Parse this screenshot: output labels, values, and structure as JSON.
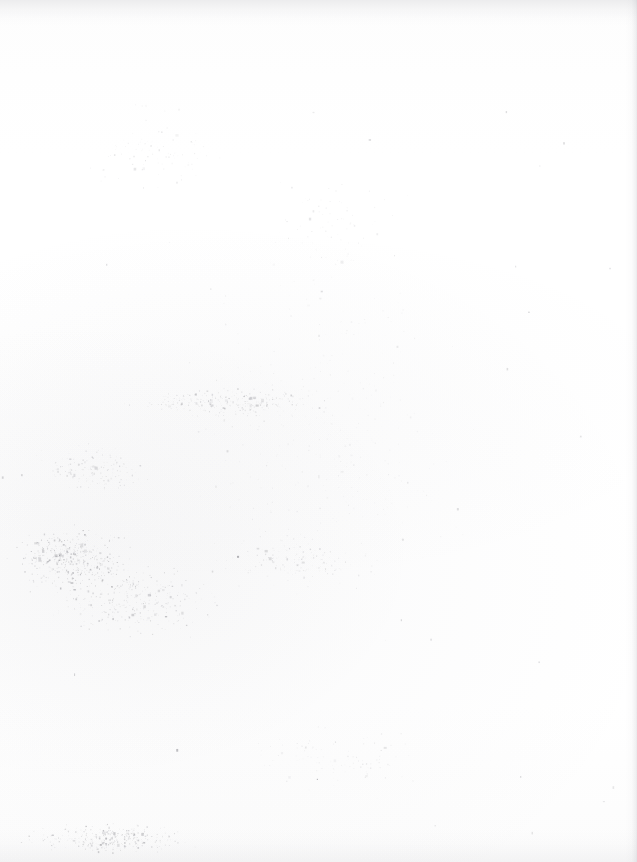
{
  "document": {
    "kind": "scanned-page",
    "page_content": "",
    "page_text": "",
    "is_blank": true,
    "description": "Blank scanned sheet of paper with no printed text, figures, tables or headings visible",
    "orientation": "portrait",
    "width_px": 637,
    "height_px": 862
  },
  "appearance": {
    "paper_color": "#fefefe",
    "paper_color_alt": "#fdfdfd",
    "speck_color": "#6a6a72",
    "edge_shadow_color": "#949498",
    "top_band_color": "#96969e"
  },
  "artifacts": {
    "top_edge_band": {
      "present": true,
      "height_px": 26,
      "note": "faint grey scanner edge band across the top"
    },
    "right_edge_line": {
      "present": true,
      "x_start_px": 625,
      "width_px": 12,
      "note": "faint vertical page border shadow at right margin"
    },
    "bottom_edge_band": {
      "present": true,
      "height_px": 34,
      "note": "soft shading along the bottom edge"
    }
  },
  "speckle": {
    "seed": 20240517,
    "note": "scanner dust and speckle noise; no legible marks",
    "clusters": [
      {
        "name": "lower-left-dense",
        "cx": 70,
        "cy": 560,
        "rx": 130,
        "ry": 70,
        "count": 420,
        "opacity": 0.34
      },
      {
        "name": "lower-left-wide",
        "cx": 130,
        "cy": 600,
        "rx": 185,
        "ry": 85,
        "count": 330,
        "opacity": 0.26
      },
      {
        "name": "bottom-left-strip",
        "cx": 110,
        "cy": 838,
        "rx": 175,
        "ry": 34,
        "count": 300,
        "opacity": 0.3
      },
      {
        "name": "mid-band-diffuse",
        "cx": 230,
        "cy": 402,
        "rx": 215,
        "ry": 34,
        "count": 260,
        "opacity": 0.24
      },
      {
        "name": "mid-left-faint",
        "cx": 95,
        "cy": 470,
        "rx": 120,
        "ry": 55,
        "count": 150,
        "opacity": 0.2
      },
      {
        "name": "mid-centre-faint",
        "cx": 300,
        "cy": 560,
        "rx": 180,
        "ry": 60,
        "count": 140,
        "opacity": 0.18
      },
      {
        "name": "upper-left-sparse",
        "cx": 150,
        "cy": 150,
        "rx": 150,
        "ry": 110,
        "count": 90,
        "opacity": 0.15
      },
      {
        "name": "upper-centre-sparse",
        "cx": 330,
        "cy": 230,
        "rx": 170,
        "ry": 120,
        "count": 80,
        "opacity": 0.14
      },
      {
        "name": "bottom-centre",
        "cx": 330,
        "cy": 760,
        "rx": 200,
        "ry": 80,
        "count": 100,
        "opacity": 0.15
      },
      {
        "name": "page-wide-dust",
        "cx": 318,
        "cy": 431,
        "rx": 318,
        "ry": 431,
        "count": 330,
        "opacity": 0.11
      }
    ]
  }
}
